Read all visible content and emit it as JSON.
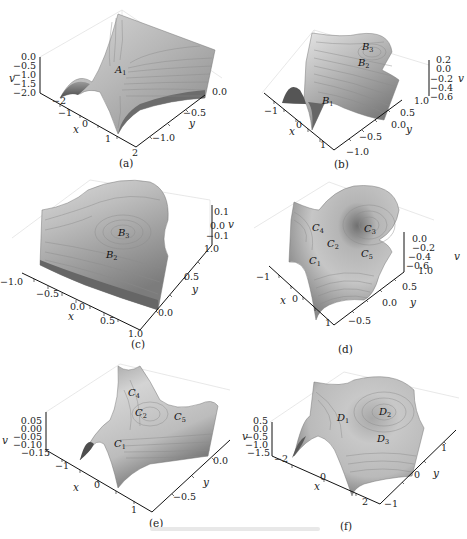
{
  "figure": {
    "panels": [
      {
        "id": "a",
        "label": "(a)",
        "v_label": "v",
        "x_label": "x",
        "y_label": "y",
        "v_ticks": [
          "0.0",
          "−0.5",
          "−1.0",
          "−1.5",
          "−2.0"
        ],
        "x_ticks": [
          "−2",
          "−1",
          "0",
          "1",
          "2"
        ],
        "y_ticks": [
          "0.0",
          "−0.5",
          "−1.0"
        ],
        "points": [
          {
            "name": "A",
            "sub": "1"
          }
        ]
      },
      {
        "id": "b",
        "label": "(b)",
        "v_label": "v",
        "x_label": "x",
        "y_label": "y",
        "v_ticks": [
          "0.2",
          "0.0",
          "−0.2",
          "−0.4",
          "−0.6"
        ],
        "x_ticks": [
          "−1",
          "0",
          "1"
        ],
        "y_ticks": [
          "1.0",
          "0.5",
          "0.0",
          "−0.5",
          "−1.0"
        ],
        "points": [
          {
            "name": "B",
            "sub": "3"
          },
          {
            "name": "B",
            "sub": "2"
          },
          {
            "name": "B",
            "sub": "1"
          }
        ]
      },
      {
        "id": "c",
        "label": "(c)",
        "v_label": "v",
        "x_label": "x",
        "y_label": "y",
        "v_ticks": [
          "0.1",
          "0.0",
          "−0.1"
        ],
        "x_ticks": [
          "−1.0",
          "−0.5",
          "0.0",
          "0.5",
          "1.0"
        ],
        "y_ticks": [
          "1.0",
          "0.5",
          "0.0"
        ],
        "points": [
          {
            "name": "B",
            "sub": "3"
          },
          {
            "name": "B",
            "sub": "2"
          }
        ]
      },
      {
        "id": "d",
        "label": "(d)",
        "v_label": "v",
        "x_label": "x",
        "y_label": "y",
        "v_ticks": [
          "0.0",
          "−0.2",
          "−0.4",
          "−0.6"
        ],
        "x_ticks": [
          "−1",
          "0",
          "1"
        ],
        "y_ticks": [
          "1.0",
          "0.5",
          "0.0",
          "−0.5"
        ],
        "points": [
          {
            "name": "C",
            "sub": "4"
          },
          {
            "name": "C",
            "sub": "3"
          },
          {
            "name": "C",
            "sub": "2"
          },
          {
            "name": "C",
            "sub": "5"
          },
          {
            "name": "C",
            "sub": "1"
          }
        ]
      },
      {
        "id": "e",
        "label": "(e)",
        "v_label": "v",
        "x_label": "x",
        "y_label": "y",
        "v_ticks": [
          "0.05",
          "0.00",
          "−0.05",
          "−0.10",
          "−0.15"
        ],
        "x_ticks": [
          "−1",
          "0",
          "1"
        ],
        "y_ticks": [
          "0.0",
          "−0.5"
        ],
        "points": [
          {
            "name": "C",
            "sub": "4"
          },
          {
            "name": "C",
            "sub": "2"
          },
          {
            "name": "C",
            "sub": "5"
          },
          {
            "name": "C",
            "sub": "1"
          }
        ]
      },
      {
        "id": "f",
        "label": "(f)",
        "v_label": "v",
        "x_label": "x",
        "y_label": "y",
        "v_ticks": [
          "0.5",
          "0.0",
          "−0.5",
          "−1.0",
          "−1.5"
        ],
        "x_ticks": [
          "−2",
          "0",
          "2"
        ],
        "y_ticks": [
          "1",
          "0",
          "−1"
        ],
        "points": [
          {
            "name": "D",
            "sub": "1"
          },
          {
            "name": "D",
            "sub": "2"
          },
          {
            "name": "D",
            "sub": "3"
          }
        ]
      }
    ],
    "colors": {
      "surface_light": "#e6e6e6",
      "surface_mid": "#a8a8a8",
      "surface_dark": "#5a5a5a",
      "contour": "#7a7a7a",
      "axis": "#111111",
      "box": "#dddddd"
    }
  }
}
